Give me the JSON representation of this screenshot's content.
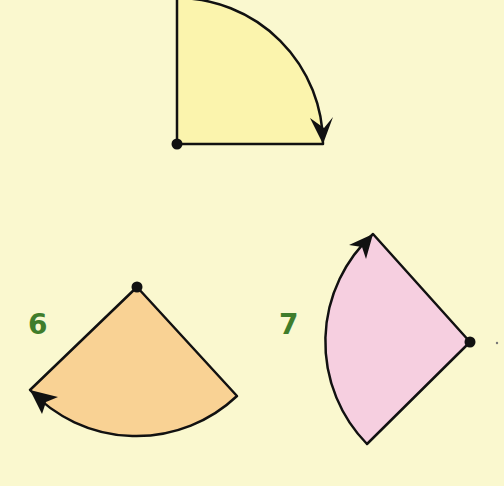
{
  "colors": {
    "background": "#faf8cf",
    "label": "#3f7d2b",
    "stroke": "#111111",
    "shape_top_fill": "#fbf4ad",
    "shape_6_fill": "#f9d294",
    "shape_7_fill": "#f6cfe0"
  },
  "shapes": [
    {
      "id": "top",
      "label": "",
      "type": "quarter-turn sector",
      "direction": "clockwise",
      "fill": "#fbf4ad"
    },
    {
      "id": "6",
      "label": "6",
      "type": "sector",
      "direction": "clockwise",
      "fill": "#f9d294"
    },
    {
      "id": "7",
      "label": "7",
      "type": "sector",
      "direction": "clockwise",
      "fill": "#f6cfe0"
    }
  ],
  "labels": {
    "six": "6",
    "seven": "7"
  }
}
